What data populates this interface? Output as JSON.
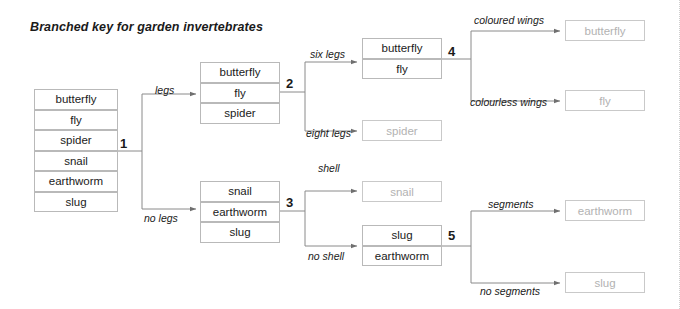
{
  "title": "Branched key for garden invertebrates",
  "groups": [
    {
      "name": "start-group",
      "x": 34,
      "y": 89,
      "w": 84,
      "rowh": 20.5,
      "items": [
        {
          "label": "butterfly",
          "terminal": false
        },
        {
          "label": "fly",
          "terminal": false
        },
        {
          "label": "spider",
          "terminal": false
        },
        {
          "label": "snail",
          "terminal": false
        },
        {
          "label": "earthworm",
          "terminal": false
        },
        {
          "label": "slug",
          "terminal": false
        }
      ]
    },
    {
      "name": "legs-group",
      "x": 200,
      "y": 62,
      "w": 80,
      "rowh": 20.5,
      "items": [
        {
          "label": "butterfly",
          "terminal": false
        },
        {
          "label": "fly",
          "terminal": false
        },
        {
          "label": "spider",
          "terminal": false
        }
      ]
    },
    {
      "name": "no-legs-group",
      "x": 200,
      "y": 181,
      "w": 80,
      "rowh": 20.5,
      "items": [
        {
          "label": "snail",
          "terminal": false
        },
        {
          "label": "earthworm",
          "terminal": false
        },
        {
          "label": "slug",
          "terminal": false
        }
      ]
    },
    {
      "name": "six-legs-group",
      "x": 362,
      "y": 38,
      "w": 80,
      "rowh": 20.5,
      "items": [
        {
          "label": "butterfly",
          "terminal": false
        },
        {
          "label": "fly",
          "terminal": false
        }
      ]
    },
    {
      "name": "eight-legs-group",
      "x": 362,
      "y": 120,
      "w": 80,
      "rowh": 21,
      "items": [
        {
          "label": "spider",
          "terminal": true
        }
      ]
    },
    {
      "name": "shell-group",
      "x": 362,
      "y": 181,
      "w": 80,
      "rowh": 21,
      "items": [
        {
          "label": "snail",
          "terminal": true
        }
      ]
    },
    {
      "name": "no-shell-group",
      "x": 362,
      "y": 225,
      "w": 80,
      "rowh": 20.5,
      "items": [
        {
          "label": "slug",
          "terminal": false
        },
        {
          "label": "earthworm",
          "terminal": false
        }
      ]
    },
    {
      "name": "coloured-wings-group",
      "x": 565,
      "y": 20,
      "w": 80,
      "rowh": 21,
      "items": [
        {
          "label": "butterfly",
          "terminal": true
        }
      ]
    },
    {
      "name": "colourless-wings-group",
      "x": 565,
      "y": 90,
      "w": 80,
      "rowh": 21,
      "items": [
        {
          "label": "fly",
          "terminal": true
        }
      ]
    },
    {
      "name": "segments-group",
      "x": 565,
      "y": 200,
      "w": 80,
      "rowh": 21,
      "items": [
        {
          "label": "earthworm",
          "terminal": true
        }
      ]
    },
    {
      "name": "no-segments-group",
      "x": 565,
      "y": 272,
      "w": 80,
      "rowh": 21,
      "items": [
        {
          "label": "slug",
          "terminal": true
        }
      ]
    }
  ],
  "nodes": [
    {
      "name": "node-1",
      "label": "1",
      "x": 120,
      "y": 136
    },
    {
      "name": "node-2",
      "label": "2",
      "x": 286,
      "y": 76
    },
    {
      "name": "node-3",
      "label": "3",
      "x": 286,
      "y": 195
    },
    {
      "name": "node-4",
      "label": "4",
      "x": 448,
      "y": 44
    },
    {
      "name": "node-5",
      "label": "5",
      "x": 448,
      "y": 228
    }
  ],
  "edge_labels": [
    {
      "name": "edge-label-legs",
      "label": "legs",
      "x": 155,
      "y": 84
    },
    {
      "name": "edge-label-no-legs",
      "label": "no legs",
      "x": 144,
      "y": 212
    },
    {
      "name": "edge-label-six-legs",
      "label": "six legs",
      "x": 310,
      "y": 48
    },
    {
      "name": "edge-label-eight-legs",
      "label": "eight legs",
      "x": 306,
      "y": 127
    },
    {
      "name": "edge-label-shell",
      "label": "shell",
      "x": 318,
      "y": 162
    },
    {
      "name": "edge-label-no-shell",
      "label": "no shell",
      "x": 308,
      "y": 250
    },
    {
      "name": "edge-label-coloured-wings",
      "label": "coloured wings",
      "x": 474,
      "y": 14
    },
    {
      "name": "edge-label-colourless-wings",
      "label": "colourless wings",
      "x": 470,
      "y": 96
    },
    {
      "name": "edge-label-segments",
      "label": "segments",
      "x": 488,
      "y": 198
    },
    {
      "name": "edge-label-no-segments",
      "label": "no segments",
      "x": 480,
      "y": 285
    }
  ],
  "colors": {
    "box_border": "#b9b9b9",
    "terminal_text": "#b2b2b2",
    "text": "#1a1a1a",
    "line": "#7a7a7a"
  }
}
